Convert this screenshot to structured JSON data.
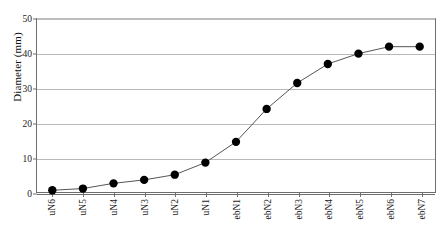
{
  "chart_data": {
    "type": "line",
    "title": "",
    "xlabel": "",
    "ylabel": "Diameter (mm)",
    "ylim": [
      0,
      50
    ],
    "yticks": [
      0,
      10,
      20,
      30,
      40,
      50
    ],
    "grid": true,
    "legend": null,
    "marker": "filled-circle",
    "categories": [
      "uN6",
      "uN5",
      "uN4",
      "uN3",
      "uN2",
      "uN1",
      "ebN1",
      "ebN2",
      "ebN3",
      "ebN4",
      "ebN5",
      "ebN6",
      "ebN7"
    ],
    "values": [
      0.5,
      1.0,
      2.5,
      3.5,
      5.0,
      8.5,
      14.5,
      24.0,
      31.5,
      37.0,
      40.0,
      42.0,
      42.0
    ],
    "series": [
      {
        "name": "Diameter",
        "values": [
          0.5,
          1.0,
          2.5,
          3.5,
          5.0,
          8.5,
          14.5,
          24.0,
          31.5,
          37.0,
          40.0,
          42.0,
          42.0
        ]
      }
    ],
    "colors": {
      "marker": "#000000",
      "line": "#555555",
      "grid": "#b9b9b9",
      "axis": "#6e6e6e"
    }
  },
  "caption": {
    "text": "Figure 4.23 Strut diameter trend",
    "visible_fragment": ""
  }
}
